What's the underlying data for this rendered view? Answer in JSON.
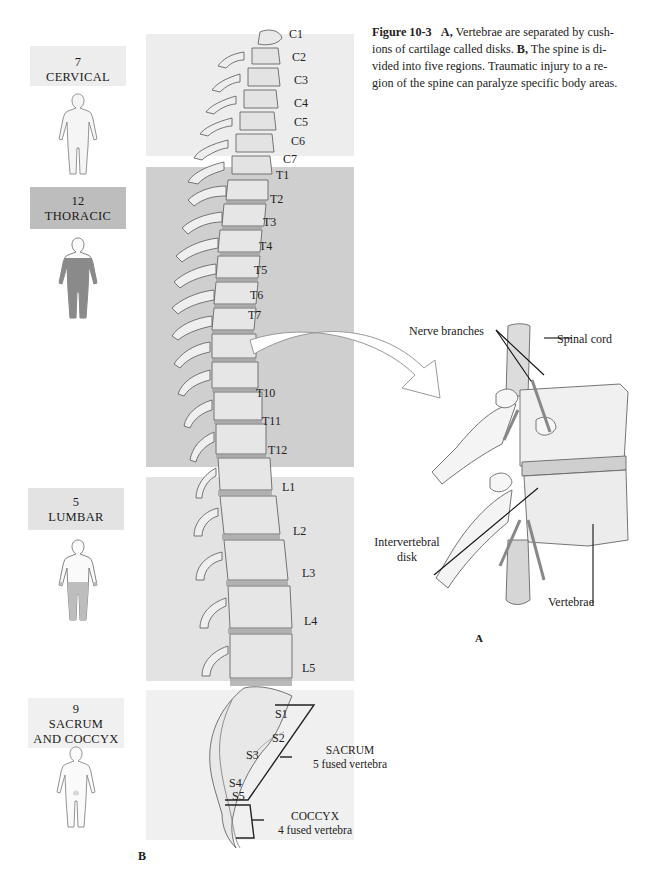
{
  "caption": {
    "figure_number": "Figure 10-3",
    "part_a_label": "A,",
    "part_a_text": "Vertebrae are separated by cushions of cartilage called disks.",
    "part_b_label": "B,",
    "part_b_text": "The spine is divided into five regions. Traumatic injury to a region of the spine can paralyze specific body areas.",
    "lines": [
      "ions of cartilage called disks.",
      "vided into five regions. Traumatic injury to a re-",
      "gion of the spine can paralyze specific body areas."
    ],
    "line1_text": "Vertebrae are separated by cush-",
    "line2_pre": "ions of cartilage called disks. ",
    "line2_post": " The spine is di-"
  },
  "regions": [
    {
      "count": "7",
      "name": "CERVICAL",
      "shade": "#ededed"
    },
    {
      "count": "12",
      "name": "THORACIC",
      "shade": "#bdbdbd"
    },
    {
      "count": "5",
      "name": "LUMBAR",
      "shade": "#e3e3e3"
    },
    {
      "count": "9",
      "name": "SACRUM",
      "name2": "AND COCCYX",
      "shade": "#f0f0f0"
    }
  ],
  "vertebra_labels": {
    "cervical": [
      "C1",
      "C2",
      "C3",
      "C4",
      "C5",
      "C6",
      "C7"
    ],
    "thoracic": [
      "T1",
      "T2",
      "T3",
      "T4",
      "T5",
      "T6",
      "T7",
      "T10",
      "T11",
      "T12"
    ],
    "lumbar": [
      "L1",
      "L2",
      "L3",
      "L4",
      "L5"
    ],
    "sacral": [
      "S1",
      "S2",
      "S3",
      "S4",
      "S5"
    ]
  },
  "brackets": {
    "sacrum_title": "SACRUM",
    "sacrum_sub": "5 fused vertebra",
    "coccyx_title": "COCCYX",
    "coccyx_sub": "4 fused vertebra"
  },
  "panel_a": {
    "letter": "A",
    "nerve_branches": "Nerve branches",
    "spinal_cord": "Spinal cord",
    "intervertebral_1": "Intervertebral",
    "intervertebral_2": "disk",
    "vertebrae": "Vertebrae"
  },
  "panel_b": {
    "letter": "B"
  }
}
